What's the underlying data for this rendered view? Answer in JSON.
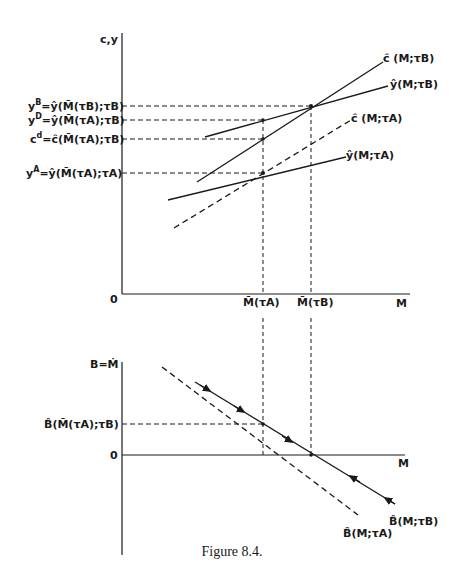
{
  "caption": "Figure 8.4.",
  "upper": {
    "y_axis_label": "c, y",
    "x_axis_label": "M",
    "origin_label": "0",
    "x_ticks": [
      {
        "label": "M̄(τ^A)",
        "x": 263
      },
      {
        "label": "M̄(τ^B)",
        "x": 311
      }
    ],
    "y_ticks": [
      {
        "label": "y^B = ŷ(M̄(τ^B); τ^B)",
        "y": 106
      },
      {
        "label": "y^D = ŷ(M̄(τ^A); τ^B)",
        "y": 120
      },
      {
        "label": "c^d = ĉ(M̄(τ^A); τ^B)",
        "y": 139
      },
      {
        "label": "y^A = ŷ(M̄(τ^A); τ^A)",
        "y": 173
      }
    ],
    "curves": [
      {
        "label": "ĉ(M; τ^B)",
        "style": "solid"
      },
      {
        "label": "ŷ(M; τ^B)",
        "style": "solid"
      },
      {
        "label": "ĉ(M; τ^A)",
        "style": "dashed"
      },
      {
        "label": "ŷ(M; τ^A)",
        "style": "solid"
      }
    ]
  },
  "lower": {
    "y_axis_label": "B = Ṁ",
    "x_axis_label": "M",
    "origin_label": "0",
    "y_ticks": [
      {
        "label": "B̂(M̄(τ^A); τ^B)",
        "y": 424
      }
    ],
    "curves": [
      {
        "label": "B̂(M; τ^B)",
        "style": "solid",
        "arrows": "converge to M̄(τ^B)"
      },
      {
        "label": "B̂(M; τ^A)",
        "style": "dashed"
      }
    ]
  },
  "labels": {
    "upper_y": "c,y",
    "upper_origin": "0",
    "upper_x": "M",
    "tick_MA": "M̄(τA)",
    "tick_MB": "M̄(τB)",
    "lower_y": "B=Ṁ",
    "lower_origin": "0",
    "lower_x": "M",
    "yB_pre": "y",
    "yB_sup": "B",
    "yB_rest": "=ŷ(M̄(τB);τB)",
    "yD_pre": "y",
    "yD_sup": "D",
    "yD_rest": "=ŷ(M̄(τA);τB)",
    "cd_pre": "c",
    "cd_sup": "d",
    "cd_rest": "=ĉ(M̄(τA);τB)",
    "yA_pre": "y",
    "yA_sup": "A",
    "yA_rest": "=ŷ(M̄(τA);τA)",
    "cB": "ĉ (M;τB)",
    "yhatB": "ŷ(M;τB)",
    "cA": "ĉ (M;τA)",
    "yhatA": "ŷ(M;τA)",
    "Btick": "B̂(M̄(τA);τB)",
    "BcurveB": "B̂(M;τB)",
    "BcurveA": "B̂(M;τA)"
  }
}
